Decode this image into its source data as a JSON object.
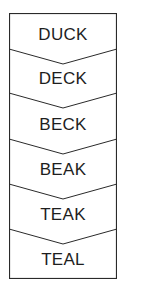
{
  "diagram": {
    "type": "word-ladder",
    "words": [
      "DUCK",
      "DECK",
      "BECK",
      "BEAK",
      "TEAK",
      "TEAL"
    ],
    "colors": {
      "stroke": "#2a2a2a",
      "text": "#1e1e1e",
      "background": "#ffffff"
    }
  }
}
